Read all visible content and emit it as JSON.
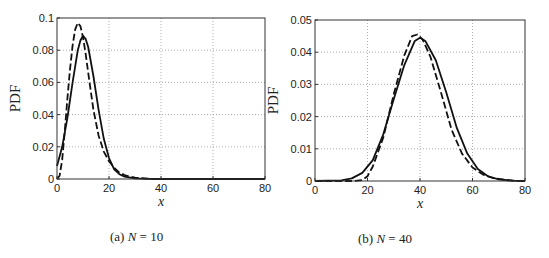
{
  "chart_data": [
    {
      "type": "line",
      "caption_prefix": "(a)",
      "caption_var": "N",
      "caption_rest": " = 10",
      "xlabel": "x",
      "ylabel": "PDF",
      "xlim": [
        0,
        80
      ],
      "ylim": [
        0,
        0.1
      ],
      "xticks": [
        0,
        20,
        40,
        60,
        80
      ],
      "yticks": [
        0,
        0.02,
        0.04,
        0.06,
        0.08,
        0.1
      ],
      "ytick_labels": [
        "0",
        "0.02",
        "0.04",
        "0.06",
        "0.08",
        "0.1"
      ],
      "grid": true,
      "box": {
        "left": 57,
        "top": 18,
        "right": 265,
        "bottom": 179
      },
      "series": [
        {
          "name": "solid",
          "style": "solid",
          "x": [
            0,
            2,
            4,
            6,
            8,
            9,
            10,
            11,
            12,
            14,
            16,
            18,
            20,
            22,
            24,
            26,
            30,
            35,
            40,
            50,
            80
          ],
          "y": [
            0.008,
            0.02,
            0.038,
            0.06,
            0.08,
            0.086,
            0.089,
            0.087,
            0.082,
            0.064,
            0.043,
            0.025,
            0.013,
            0.006,
            0.003,
            0.0015,
            0.0004,
            0.0001,
            0,
            0,
            0
          ]
        },
        {
          "name": "dashed",
          "style": "dashed",
          "x": [
            0,
            1,
            2,
            3,
            4,
            5,
            6,
            7,
            8,
            9,
            10,
            11,
            12,
            14,
            16,
            18,
            20,
            22,
            24,
            26,
            28,
            30,
            35,
            40,
            80
          ],
          "y": [
            0,
            0.002,
            0.012,
            0.03,
            0.05,
            0.068,
            0.083,
            0.093,
            0.097,
            0.095,
            0.088,
            0.078,
            0.066,
            0.043,
            0.027,
            0.017,
            0.011,
            0.007,
            0.004,
            0.0025,
            0.0015,
            0.0008,
            0.0002,
            0,
            0
          ]
        }
      ]
    },
    {
      "type": "line",
      "caption_prefix": "(b)",
      "caption_var": "N",
      "caption_rest": " = 40",
      "xlabel": "x",
      "ylabel": "PDF",
      "xlim": [
        0,
        80
      ],
      "ylim": [
        0,
        0.05
      ],
      "xticks": [
        0,
        20,
        40,
        60,
        80
      ],
      "yticks": [
        0,
        0.01,
        0.02,
        0.03,
        0.04,
        0.05
      ],
      "ytick_labels": [
        "0",
        "0.01",
        "0.02",
        "0.03",
        "0.04",
        "0.05"
      ],
      "grid": true,
      "box": {
        "left": 315,
        "top": 20,
        "right": 525,
        "bottom": 181
      },
      "series": [
        {
          "name": "solid",
          "style": "solid",
          "x": [
            0,
            10,
            14,
            18,
            22,
            26,
            30,
            34,
            38,
            40,
            42,
            46,
            50,
            54,
            58,
            62,
            66,
            70,
            75,
            80
          ],
          "y": [
            0,
            0.0002,
            0.0008,
            0.0025,
            0.0065,
            0.0145,
            0.0255,
            0.036,
            0.0435,
            0.0445,
            0.0435,
            0.0375,
            0.0275,
            0.0165,
            0.0085,
            0.0037,
            0.0014,
            0.0005,
            0.0001,
            0
          ]
        },
        {
          "name": "dashed",
          "style": "dashed",
          "x": [
            0,
            15,
            18,
            20,
            22,
            26,
            30,
            34,
            37,
            39,
            41,
            44,
            48,
            52,
            56,
            60,
            64,
            68,
            72,
            76,
            80
          ],
          "y": [
            0,
            0,
            0.0003,
            0.0015,
            0.0045,
            0.0135,
            0.027,
            0.039,
            0.045,
            0.0455,
            0.044,
            0.0385,
            0.0275,
            0.016,
            0.0085,
            0.0042,
            0.002,
            0.0009,
            0.0004,
            0.0001,
            0
          ]
        }
      ]
    }
  ]
}
